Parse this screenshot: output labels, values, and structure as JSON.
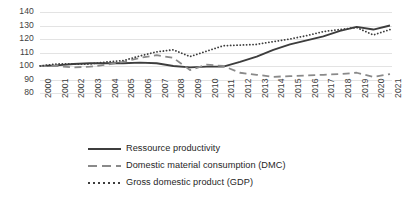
{
  "chart_data": {
    "type": "line",
    "title": "",
    "subtitle": "",
    "xlabel": "",
    "ylabel": "",
    "ylim": [
      80,
      140
    ],
    "yticks": [
      80,
      90,
      100,
      110,
      120,
      130,
      140
    ],
    "grid": true,
    "legend_position": "bottom",
    "index_base": "2000 = 100",
    "categories": [
      "2000",
      "2001",
      "2002",
      "2003",
      "2004",
      "2005",
      "2006",
      "2007",
      "2008",
      "2009",
      "2010",
      "2011",
      "2012",
      "2013",
      "2014",
      "2015",
      "2016",
      "2017",
      "2018",
      "2019",
      "2020",
      "2021"
    ],
    "series": [
      {
        "name": "Ressource productivity",
        "style": "solid",
        "color": "#3d3d3d",
        "values": [
          100,
          100.5,
          101.5,
          102,
          102,
          102,
          102.5,
          102,
          100,
          99,
          99.5,
          99.5,
          103,
          107,
          112,
          116,
          119,
          122,
          126,
          129,
          127,
          130
        ]
      },
      {
        "name": "Domestic material consumption (DMC)",
        "style": "dashed",
        "color": "#8a8a8a",
        "values": [
          100,
          100,
          99,
          99.5,
          101,
          103,
          106,
          108,
          106,
          97,
          101,
          100,
          95,
          93.5,
          92,
          92.5,
          93,
          93.5,
          94,
          95,
          92,
          94
        ]
      },
      {
        "name": "Gross domestic product (GDP)",
        "style": "dotted",
        "color": "#3d3d3d",
        "values": [
          100,
          101.5,
          101.5,
          101.5,
          103,
          104,
          107.5,
          110.5,
          112,
          107,
          111,
          115,
          115.5,
          116,
          118,
          120,
          122.5,
          125.5,
          127,
          128.5,
          123,
          127
        ]
      }
    ],
    "legend": [
      {
        "label": "Ressource productivity",
        "style": "solid"
      },
      {
        "label": "Domestic material consumption (DMC)",
        "style": "dashed"
      },
      {
        "label": "Gross domestic product (GDP)",
        "style": "dotted"
      }
    ]
  },
  "colors": {
    "grid": "#e3e3e3",
    "text": "#3f3f3f",
    "series_dark": "#3d3d3d",
    "series_gray": "#8a8a8a",
    "background": "#ffffff"
  }
}
